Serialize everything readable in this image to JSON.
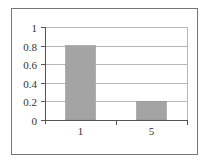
{
  "chart_data": {
    "type": "bar",
    "title": "",
    "xlabel": "",
    "ylabel": "",
    "categories": [
      "1",
      "5"
    ],
    "values": [
      0.8,
      0.2
    ],
    "ylim": [
      0,
      1
    ],
    "yticks": [
      0,
      0.2,
      0.4,
      0.6,
      0.8,
      1
    ],
    "ytick_labels": [
      "0",
      "0.2",
      "0.4",
      "0.6",
      "0.8",
      "1"
    ],
    "grid": true,
    "legend": null
  },
  "style": {
    "bar_color": "#a4a4a4",
    "bar_edge_color": "#8a8a8a",
    "grid_color": "#b8b8b8",
    "axis_color": "#555555",
    "frame_color": "#777777",
    "background": "#ffffff"
  }
}
